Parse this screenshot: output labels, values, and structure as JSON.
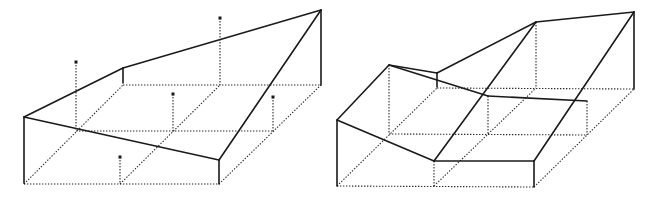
{
  "figure": {
    "panels": [
      {
        "id": "left",
        "description": "Sloped single-plane surface over a 2x2 gridded box with sample-point pins",
        "solid_edges": [
          [
            24,
            117,
            123,
            68
          ],
          [
            123,
            68,
            321,
            10
          ],
          [
            24,
            117,
            219,
            160
          ],
          [
            219,
            160,
            321,
            10
          ],
          [
            24,
            117,
            24,
            183
          ],
          [
            219,
            160,
            219,
            184
          ],
          [
            321,
            10,
            321,
            85
          ],
          [
            123,
            68,
            123,
            83
          ]
        ],
        "dotted_edges": [
          [
            24,
            184,
            219,
            184
          ],
          [
            76,
            131,
            273,
            131
          ],
          [
            123,
            85,
            321,
            85
          ],
          [
            24,
            184,
            123,
            85
          ],
          [
            120,
            184,
            220,
            85
          ],
          [
            219,
            184,
            321,
            85
          ]
        ],
        "pins": [
          {
            "x": 76,
            "top": 62,
            "base": 131
          },
          {
            "x": 220,
            "top": 18,
            "base": 85
          },
          {
            "x": 173,
            "top": 94,
            "base": 131
          },
          {
            "x": 273,
            "top": 97,
            "base": 131
          },
          {
            "x": 120,
            "top": 157,
            "base": 184
          }
        ]
      },
      {
        "id": "right",
        "description": "Piecewise-planar (triangulated) surface fitted to the same grid box",
        "solid_edges": [
          [
            337,
            120,
            389,
            65
          ],
          [
            389,
            65,
            437,
            73
          ],
          [
            437,
            73,
            536,
            22
          ],
          [
            536,
            22,
            634,
            12
          ],
          [
            389,
            65,
            488,
            96
          ],
          [
            488,
            96,
            587,
            101
          ],
          [
            337,
            120,
            434,
            161
          ],
          [
            434,
            161,
            534,
            161
          ],
          [
            434,
            161,
            536,
            22
          ],
          [
            534,
            161,
            634,
            12
          ],
          [
            337,
            120,
            337,
            186
          ],
          [
            534,
            161,
            534,
            187
          ],
          [
            634,
            12,
            634,
            89
          ],
          [
            437,
            73,
            437,
            87
          ]
        ],
        "dotted_edges": [
          [
            337,
            186,
            534,
            187
          ],
          [
            389,
            134,
            587,
            135
          ],
          [
            437,
            88,
            634,
            89
          ],
          [
            337,
            186,
            437,
            88
          ],
          [
            434,
            186,
            536,
            88
          ],
          [
            534,
            187,
            634,
            89
          ],
          [
            389,
            65,
            389,
            134
          ],
          [
            488,
            96,
            488,
            134
          ],
          [
            587,
            101,
            587,
            135
          ],
          [
            536,
            22,
            536,
            88
          ],
          [
            434,
            161,
            434,
            186
          ]
        ],
        "pins": []
      }
    ]
  }
}
